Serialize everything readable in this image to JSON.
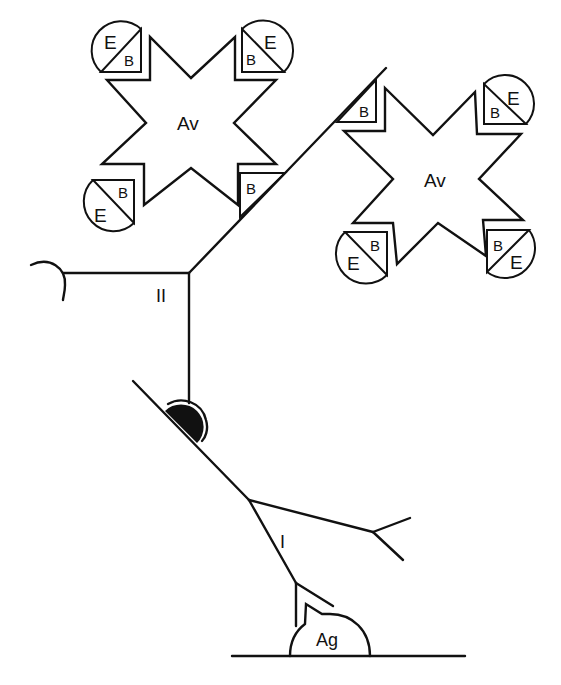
{
  "diagram": {
    "colors": {
      "ink": "#111111",
      "background": "#ffffff"
    },
    "labels": {
      "avidin_1": "Av",
      "avidin_2": "Av",
      "secondary_antibody": "II",
      "primary_antibody": "I",
      "antigen": "Ag",
      "biotin": "B",
      "enzyme": "E"
    },
    "avidin_complexes": [
      {
        "label": "Av",
        "units": [
          {
            "position": "top-left",
            "biotin": "B",
            "enzyme": "E"
          },
          {
            "position": "top-right",
            "biotin": "B",
            "enzyme": "E"
          },
          {
            "position": "bottom-left",
            "biotin": "B",
            "enzyme": "E"
          },
          {
            "position": "bottom-right",
            "biotin": "B",
            "bound_to": "secondary_antibody"
          }
        ]
      },
      {
        "label": "Av",
        "units": [
          {
            "position": "top-left",
            "biotin": "B",
            "bound_to": "secondary_antibody"
          },
          {
            "position": "top-right",
            "biotin": "B",
            "enzyme": "E"
          },
          {
            "position": "bottom-left",
            "biotin": "B",
            "enzyme": "E"
          },
          {
            "position": "bottom-right",
            "biotin": "B",
            "enzyme": "E"
          }
        ]
      }
    ]
  }
}
